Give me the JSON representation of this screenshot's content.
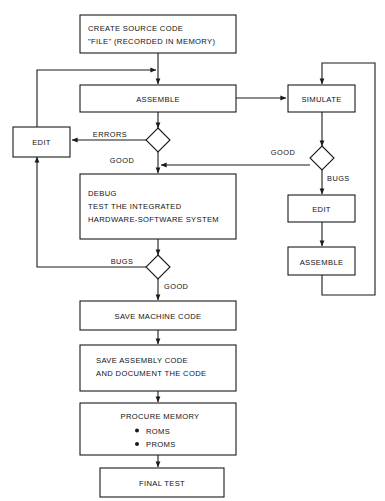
{
  "diagram": {
    "colors": {
      "stroke": "#1a1a1a",
      "text": "#111111",
      "background": "#ffffff"
    },
    "nodes": {
      "create_source": {
        "type": "process",
        "lines": [
          "CREATE SOURCE CODE",
          "\"FILE\" (RECORDED IN MEMORY)"
        ]
      },
      "assemble_main": {
        "type": "process",
        "lines": [
          "ASSEMBLE"
        ]
      },
      "edit_left": {
        "type": "process",
        "lines": [
          "EDIT"
        ]
      },
      "debug": {
        "type": "process",
        "lines": [
          "DEBUG",
          "TEST THE INTEGRATED",
          "HARDWARE-SOFTWARE SYSTEM"
        ]
      },
      "save_machine_code": {
        "type": "process",
        "lines": [
          "SAVE MACHINE CODE"
        ]
      },
      "save_assembly_code": {
        "type": "process",
        "lines": [
          "SAVE ASSEMBLY CODE",
          "AND DOCUMENT THE CODE"
        ]
      },
      "procure_memory": {
        "type": "process",
        "lines": [
          "PROCURE MEMORY"
        ],
        "bullets": [
          "ROMS",
          "PROMS"
        ]
      },
      "final_test": {
        "type": "process",
        "lines": [
          "FINAL TEST"
        ]
      },
      "simulate": {
        "type": "process",
        "lines": [
          "SIMULATE"
        ]
      },
      "edit_right": {
        "type": "process",
        "lines": [
          "EDIT"
        ]
      },
      "assemble_right": {
        "type": "process",
        "lines": [
          "ASSEMBLE"
        ]
      },
      "decision_assemble": {
        "type": "decision",
        "label": ""
      },
      "decision_debug": {
        "type": "decision",
        "label": ""
      },
      "decision_simulate": {
        "type": "decision",
        "label": ""
      }
    },
    "edge_labels": {
      "errors": "ERRORS",
      "good_assemble": "GOOD",
      "bugs_debug": "BUGS",
      "good_debug": "GOOD",
      "good_simulate": "GOOD",
      "bugs_simulate": "BUGS"
    }
  }
}
